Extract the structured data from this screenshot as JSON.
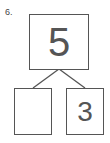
{
  "problem": {
    "number_label": "6.",
    "whole": "5",
    "part_left": "",
    "part_right": "3"
  },
  "colors": {
    "stroke": "#555555",
    "text": "#555555"
  }
}
